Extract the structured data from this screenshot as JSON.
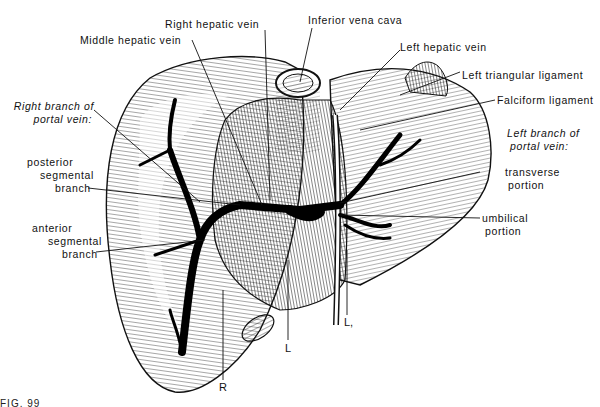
{
  "figure": {
    "caption_fragment": "FIG. 99",
    "colors": {
      "ink": "#111111",
      "paper": "#ffffff",
      "shading": "#bfbfbf"
    }
  },
  "labels": {
    "inferior_vena_cava": "Inferior vena cava",
    "right_hepatic_vein": "Right hepatic vein",
    "middle_hepatic_vein": "Middle hepatic vein",
    "left_hepatic_vein": "Left hepatic vein",
    "left_triangular_ligament": "Left triangular ligament",
    "falciform_ligament": "Falciform ligament",
    "right_branch_portal_vein_l1": "Right branch of",
    "right_branch_portal_vein_l2": "portal vein:",
    "posterior_segmental_l1": "posterior",
    "posterior_segmental_l2": "segmental",
    "posterior_segmental_l3": "branch",
    "anterior_segmental_l1": "anterior",
    "anterior_segmental_l2": "segmental",
    "anterior_segmental_l3": "branch",
    "left_branch_portal_vein_l1": "Left branch of",
    "left_branch_portal_vein_l2": "portal vein:",
    "transverse_portion_l1": "transverse",
    "transverse_portion_l2": "portion",
    "umbilical_portion_l1": "umbilical",
    "umbilical_portion_l2": "portion"
  },
  "letters": {
    "R": "R",
    "L": "L",
    "L1": "L,"
  }
}
